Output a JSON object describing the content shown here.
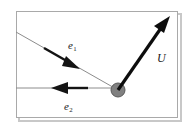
{
  "figure": {
    "background_color": "#ffffff",
    "frame": {
      "name": "figure-border",
      "x": 16,
      "y": 11,
      "width": 162,
      "height": 107,
      "stroke_color": "#a9a9a9",
      "stroke_width": 1,
      "shadow_color": "#c8c8c8"
    },
    "node": {
      "name": "origin-node",
      "cx": 118,
      "cy": 90,
      "r": 7,
      "fill_color": "#808080",
      "stroke_color": "#5a5a5a"
    },
    "axes": [
      {
        "name": "diagonal-axis-line",
        "x1": 16,
        "y1": 32,
        "x2": 118,
        "y2": 90,
        "stroke_color": "#8c8c8c",
        "stroke_width": 1
      },
      {
        "name": "horizontal-axis-line",
        "x1": 16,
        "y1": 88,
        "x2": 118,
        "y2": 88,
        "stroke_color": "#8c8c8c",
        "stroke_width": 1
      }
    ],
    "vectors": [
      {
        "name": "vector-e1",
        "label": "e",
        "subscript": "1",
        "description": "basis vector along the diagonal line, pointing down-right",
        "x1": 44,
        "y1": 48,
        "x2": 79,
        "y2": 68,
        "stroke_color": "#141414",
        "stroke_width": 2.4,
        "arrowhead": "solid-filled",
        "label_x": 68,
        "label_y": 40
      },
      {
        "name": "vector-e2",
        "label": "e",
        "subscript": "2",
        "description": "basis vector along the horizontal line, pointing left",
        "x1": 88,
        "y1": 88,
        "x2": 52,
        "y2": 88,
        "stroke_color": "#141414",
        "stroke_width": 2.4,
        "arrowhead": "solid-filled",
        "label_x": 64,
        "label_y": 101
      },
      {
        "name": "vector-u",
        "label": "U",
        "subscript": "",
        "description": "velocity vector from the node, pointing up-right",
        "x1": 118,
        "y1": 90,
        "x2": 169,
        "y2": 17,
        "stroke_color": "#0d0d0d",
        "stroke_width": 3.2,
        "arrowhead": "solid-filled",
        "label_x": 157,
        "label_y": 52
      }
    ]
  }
}
